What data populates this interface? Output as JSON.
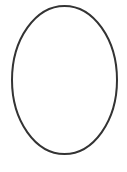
{
  "canvas": {
    "width": 127,
    "height": 172,
    "background": "#ffffff"
  },
  "shapes": [
    {
      "type": "ellipse",
      "cx": 64.5,
      "cy": 80,
      "rx": 52.5,
      "ry": 74,
      "stroke": "#333333",
      "stroke_width": 2,
      "fill": "none"
    }
  ]
}
